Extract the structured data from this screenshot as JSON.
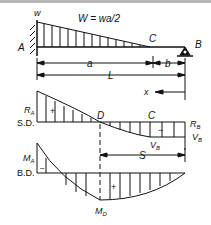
{
  "diagram": {
    "type": "beam-load-shear-moment",
    "beam": {
      "load_intensity_label": "w",
      "total_load_label": "W = wa/2",
      "fixed_end_label": "A",
      "load_end_point_label": "C",
      "roller_support_label": "B",
      "dim_a_label": "a",
      "dim_b_label": "b",
      "dim_L_label": "L"
    },
    "shear_diagram": {
      "name_label": "S.D.",
      "left_value_label": "R",
      "left_value_sub": "A",
      "zero_point_label": "D",
      "right_point_label": "C",
      "right_reaction_label": "R",
      "right_reaction_sub": "B",
      "right_value_label": "V",
      "right_value_sub": "B",
      "bottom_value_label": "V",
      "bottom_value_sub": "B",
      "positive_sign": "+",
      "negative_sign": "−",
      "x_axis_label": "x",
      "s_label": "S"
    },
    "moment_diagram": {
      "name_label": "B.D.",
      "left_value_label": "M",
      "left_value_sub": "A",
      "max_value_label": "M",
      "max_value_sub": "D",
      "positive_sign": "+",
      "negative_sign": "−"
    },
    "colors": {
      "line": "#111111",
      "background": "#ffffff"
    }
  }
}
